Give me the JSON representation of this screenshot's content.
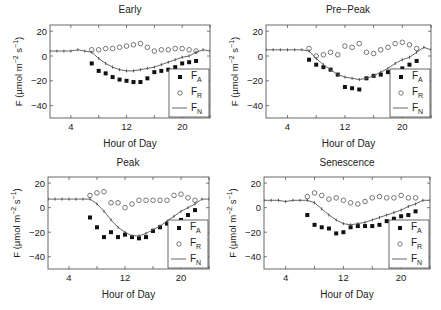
{
  "figure": {
    "ylabel": "F (µmol m⁻² s⁻¹)",
    "xlabel": "Hour of Day",
    "legend": [
      "F_A",
      "F_R",
      "F_N"
    ]
  },
  "chart_data": [
    {
      "type": "scatter",
      "title": "Early",
      "xlabel": "Hour of Day",
      "ylabel": "F (µmol m-2 s-1)",
      "xlim": [
        1,
        24
      ],
      "ylim": [
        -50,
        25
      ],
      "xticks": [
        4,
        12,
        20
      ],
      "yticks": [
        20,
        0,
        -20,
        -40
      ],
      "grid": false,
      "legend_position": "lower right",
      "series": [
        {
          "name": "F_A",
          "marker": "filled-square",
          "x": [
            7,
            8,
            9,
            10,
            11,
            12,
            13,
            14,
            15,
            16,
            17,
            18,
            19,
            20,
            21,
            22
          ],
          "values": [
            -6,
            -12,
            -14,
            -17,
            -19,
            -20,
            -21,
            -21,
            -18,
            -13,
            -12,
            -11,
            -9,
            -6,
            -5,
            -4
          ]
        },
        {
          "name": "F_R",
          "marker": "open-circle",
          "x": [
            7,
            8,
            9,
            10,
            11,
            12,
            13,
            14,
            15,
            16,
            17,
            18,
            19,
            20,
            21,
            22
          ],
          "values": [
            5,
            5,
            6,
            6,
            7,
            8,
            9,
            10,
            7,
            4,
            5,
            5,
            6,
            6,
            5,
            4
          ]
        },
        {
          "name": "F_N",
          "marker": "line",
          "x": [
            1,
            2,
            3,
            4,
            5,
            6,
            7,
            8,
            9,
            10,
            11,
            12,
            13,
            14,
            15,
            16,
            17,
            18,
            19,
            20,
            21,
            22,
            23,
            24
          ],
          "values": [
            4,
            4,
            4,
            4,
            5,
            4,
            3,
            -2,
            -6,
            -9,
            -11,
            -12,
            -12,
            -11,
            -10,
            -9,
            -7,
            -5,
            -3,
            -1,
            0,
            3,
            5,
            4
          ]
        }
      ]
    },
    {
      "type": "scatter",
      "title": "Pre−Peak",
      "xlabel": "Hour of Day",
      "ylabel": "F (µmol m-2 s-1)",
      "xlim": [
        1,
        24
      ],
      "ylim": [
        -50,
        25
      ],
      "xticks": [
        4,
        12,
        20
      ],
      "yticks": [
        20,
        0,
        -20,
        -40
      ],
      "grid": false,
      "legend_position": "lower right",
      "series": [
        {
          "name": "F_A",
          "marker": "filled-square",
          "x": [
            7,
            8,
            9,
            10,
            11,
            12,
            13,
            14,
            15,
            16,
            17,
            18,
            19,
            20,
            21,
            22
          ],
          "values": [
            -3,
            -7,
            -9,
            -11,
            -15,
            -25,
            -26,
            -27,
            -18,
            -16,
            -15,
            -13,
            -12,
            -10,
            -7,
            -4
          ]
        },
        {
          "name": "F_R",
          "marker": "open-circle",
          "x": [
            7,
            8,
            9,
            10,
            11,
            12,
            13,
            14,
            15,
            16,
            17,
            18,
            19,
            20,
            21,
            22
          ],
          "values": [
            6,
            0,
            1,
            3,
            1,
            8,
            7,
            10,
            3,
            2,
            5,
            7,
            10,
            11,
            9,
            6
          ]
        },
        {
          "name": "F_N",
          "marker": "line",
          "x": [
            1,
            2,
            3,
            4,
            5,
            6,
            7,
            8,
            9,
            10,
            11,
            12,
            13,
            14,
            15,
            16,
            17,
            18,
            19,
            20,
            21,
            22,
            23,
            24
          ],
          "values": [
            5,
            5,
            5,
            5,
            5,
            5,
            4,
            -2,
            -7,
            -11,
            -15,
            -17,
            -18,
            -19,
            -18,
            -16,
            -13,
            -10,
            -6,
            -3,
            -1,
            3,
            7,
            5
          ]
        }
      ]
    },
    {
      "type": "scatter",
      "title": "Peak",
      "xlabel": "Hour of Day",
      "ylabel": "F (µmol m-2 s-1)",
      "xlim": [
        1,
        24
      ],
      "ylim": [
        -50,
        25
      ],
      "xticks": [
        4,
        12,
        20
      ],
      "yticks": [
        20,
        0,
        -20,
        -40
      ],
      "grid": false,
      "legend_position": "lower right",
      "series": [
        {
          "name": "F_A",
          "marker": "filled-square",
          "x": [
            7,
            8,
            9,
            10,
            11,
            12,
            13,
            14,
            15,
            16,
            17,
            18,
            19,
            20,
            21,
            22
          ],
          "values": [
            -8,
            -16,
            -24,
            -20,
            -24,
            -22,
            -24,
            -25,
            -24,
            -19,
            -16,
            -13,
            -12,
            -10,
            -6,
            -2
          ]
        },
        {
          "name": "F_R",
          "marker": "open-circle",
          "x": [
            7,
            8,
            9,
            10,
            11,
            12,
            13,
            14,
            15,
            16,
            17,
            18,
            19,
            20,
            21,
            22
          ],
          "values": [
            10,
            12,
            13,
            4,
            4,
            0,
            3,
            6,
            6,
            6,
            6,
            6,
            10,
            11,
            8,
            6
          ]
        },
        {
          "name": "F_N",
          "marker": "line",
          "x": [
            1,
            2,
            3,
            4,
            5,
            6,
            7,
            8,
            9,
            10,
            11,
            12,
            13,
            14,
            15,
            16,
            17,
            18,
            19,
            20,
            21,
            22,
            23,
            24
          ],
          "values": [
            7,
            7,
            7,
            7,
            7,
            7,
            7,
            3,
            -3,
            -10,
            -16,
            -20,
            -23,
            -23,
            -21,
            -18,
            -15,
            -11,
            -7,
            -3,
            0,
            3,
            7,
            7
          ]
        }
      ]
    },
    {
      "type": "scatter",
      "title": "Senescence",
      "xlabel": "Hour of Day",
      "ylabel": "F (µmol m-2 s-1)",
      "xlim": [
        1,
        24
      ],
      "ylim": [
        -50,
        25
      ],
      "xticks": [
        4,
        12,
        20
      ],
      "yticks": [
        20,
        0,
        -20,
        -40
      ],
      "grid": false,
      "legend_position": "lower right",
      "series": [
        {
          "name": "F_A",
          "marker": "filled-square",
          "x": [
            7,
            8,
            9,
            10,
            11,
            12,
            13,
            14,
            15,
            16,
            17,
            18,
            19,
            20,
            21,
            22
          ],
          "values": [
            -6,
            -14,
            -16,
            -17,
            -21,
            -20,
            -16,
            -15,
            -15,
            -15,
            -14,
            -11,
            -9,
            -7,
            -6,
            -3
          ]
        },
        {
          "name": "F_R",
          "marker": "open-circle",
          "x": [
            7,
            8,
            9,
            10,
            11,
            12,
            13,
            14,
            15,
            16,
            17,
            18,
            19,
            20,
            21,
            22
          ],
          "values": [
            9,
            12,
            10,
            7,
            8,
            6,
            4,
            3,
            5,
            8,
            9,
            8,
            8,
            10,
            8,
            8
          ]
        },
        {
          "name": "F_N",
          "marker": "line",
          "x": [
            1,
            2,
            3,
            4,
            5,
            6,
            7,
            8,
            9,
            10,
            11,
            12,
            13,
            14,
            15,
            16,
            17,
            18,
            19,
            20,
            21,
            22,
            23,
            24
          ],
          "values": [
            6,
            6,
            6,
            5,
            6,
            6,
            6,
            4,
            -1,
            -6,
            -10,
            -13,
            -14,
            -13,
            -12,
            -10,
            -8,
            -6,
            -4,
            -2,
            1,
            3,
            6,
            6
          ]
        }
      ]
    }
  ]
}
